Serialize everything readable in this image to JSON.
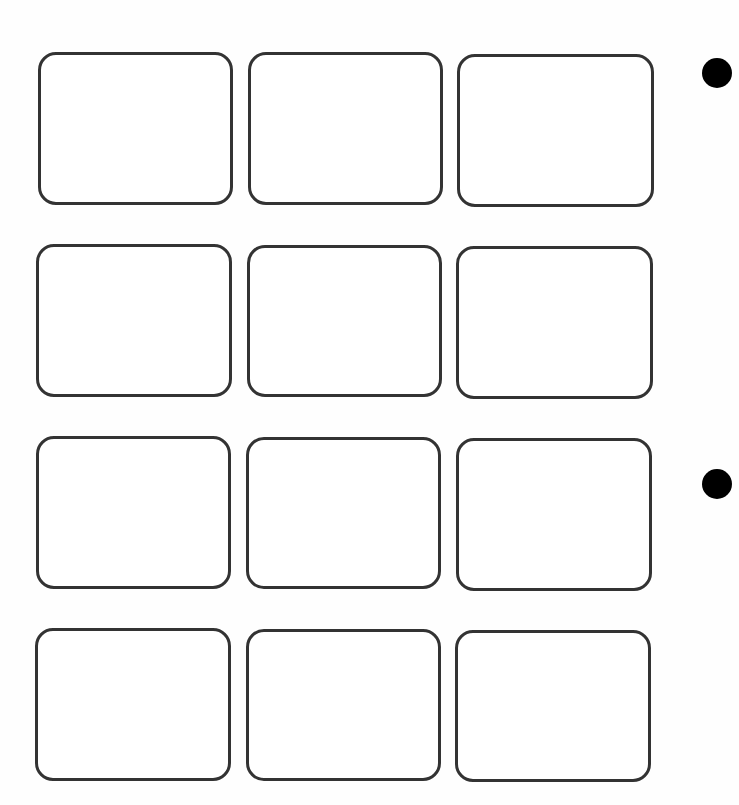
{
  "page": {
    "type": "empty card/photo slot sheet",
    "grid": {
      "rows": 4,
      "columns": 3
    },
    "colors": {
      "border": "#333333",
      "background": "#ffffff",
      "hole": "#000000"
    },
    "slots": [
      {
        "row": 1,
        "col": 1,
        "x": 38,
        "y": 52,
        "w": 195,
        "h": 153
      },
      {
        "row": 1,
        "col": 2,
        "x": 248,
        "y": 52,
        "w": 195,
        "h": 153
      },
      {
        "row": 1,
        "col": 3,
        "x": 457,
        "y": 54,
        "w": 197,
        "h": 153
      },
      {
        "row": 2,
        "col": 1,
        "x": 36,
        "y": 244,
        "w": 196,
        "h": 153
      },
      {
        "row": 2,
        "col": 2,
        "x": 247,
        "y": 245,
        "w": 195,
        "h": 152
      },
      {
        "row": 2,
        "col": 3,
        "x": 456,
        "y": 246,
        "w": 197,
        "h": 153
      },
      {
        "row": 3,
        "col": 1,
        "x": 36,
        "y": 436,
        "w": 195,
        "h": 153
      },
      {
        "row": 3,
        "col": 2,
        "x": 246,
        "y": 437,
        "w": 195,
        "h": 152
      },
      {
        "row": 3,
        "col": 3,
        "x": 456,
        "y": 438,
        "w": 196,
        "h": 153
      },
      {
        "row": 4,
        "col": 1,
        "x": 35,
        "y": 628,
        "w": 196,
        "h": 153
      },
      {
        "row": 4,
        "col": 2,
        "x": 246,
        "y": 629,
        "w": 195,
        "h": 152
      },
      {
        "row": 4,
        "col": 3,
        "x": 455,
        "y": 630,
        "w": 196,
        "h": 152
      }
    ],
    "binder_holes": [
      {
        "cx": 717,
        "cy": 73,
        "r": 15
      },
      {
        "cx": 717,
        "cy": 484,
        "r": 15
      }
    ]
  }
}
